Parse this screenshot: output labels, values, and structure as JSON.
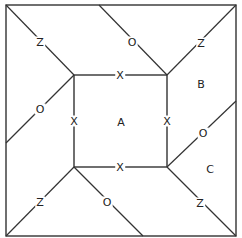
{
  "diagram": {
    "stroke_color": "#333333",
    "background": "#ffffff",
    "outer_square": {
      "x1": 6,
      "y1": 5,
      "x2": 236,
      "y2": 236
    },
    "inner_square": {
      "x1": 74,
      "y1": 75,
      "x2": 167,
      "y2": 167
    },
    "lines": [
      {
        "id": "tl-corner",
        "x1": 6,
        "y1": 5,
        "x2": 74,
        "y2": 75
      },
      {
        "id": "top-o",
        "x1": 99,
        "y1": 5,
        "x2": 167,
        "y2": 75
      },
      {
        "id": "tr-corner",
        "x1": 236,
        "y1": 5,
        "x2": 167,
        "y2": 75
      },
      {
        "id": "left-o",
        "x1": 6,
        "y1": 143,
        "x2": 74,
        "y2": 75
      },
      {
        "id": "right-o",
        "x1": 236,
        "y1": 101,
        "x2": 167,
        "y2": 167
      },
      {
        "id": "bl-corner",
        "x1": 6,
        "y1": 236,
        "x2": 74,
        "y2": 167
      },
      {
        "id": "bottom-o",
        "x1": 74,
        "y1": 167,
        "x2": 143,
        "y2": 236
      },
      {
        "id": "br-corner",
        "x1": 236,
        "y1": 236,
        "x2": 167,
        "y2": 167
      }
    ],
    "labels": [
      {
        "id": "z-top-left",
        "text": "Z",
        "x": 40,
        "y": 42
      },
      {
        "id": "o-top",
        "text": "O",
        "x": 132,
        "y": 42
      },
      {
        "id": "z-top-right",
        "text": "Z",
        "x": 201,
        "y": 43
      },
      {
        "id": "x-top",
        "text": "X",
        "x": 120,
        "y": 75
      },
      {
        "id": "b-region",
        "text": "B",
        "x": 201,
        "y": 84
      },
      {
        "id": "o-left",
        "text": "O",
        "x": 40,
        "y": 109
      },
      {
        "id": "x-left",
        "text": "X",
        "x": 74,
        "y": 121
      },
      {
        "id": "a-region",
        "text": "A",
        "x": 121,
        "y": 122
      },
      {
        "id": "x-right",
        "text": "X",
        "x": 167,
        "y": 121
      },
      {
        "id": "o-right",
        "text": "O",
        "x": 203,
        "y": 133
      },
      {
        "id": "x-bottom",
        "text": "X",
        "x": 120,
        "y": 167
      },
      {
        "id": "c-region",
        "text": "C",
        "x": 210,
        "y": 169
      },
      {
        "id": "z-bottom-left",
        "text": "Z",
        "x": 40,
        "y": 202
      },
      {
        "id": "o-bottom",
        "text": "O",
        "x": 107,
        "y": 202
      },
      {
        "id": "z-bottom-right",
        "text": "Z",
        "x": 200,
        "y": 203
      }
    ]
  }
}
